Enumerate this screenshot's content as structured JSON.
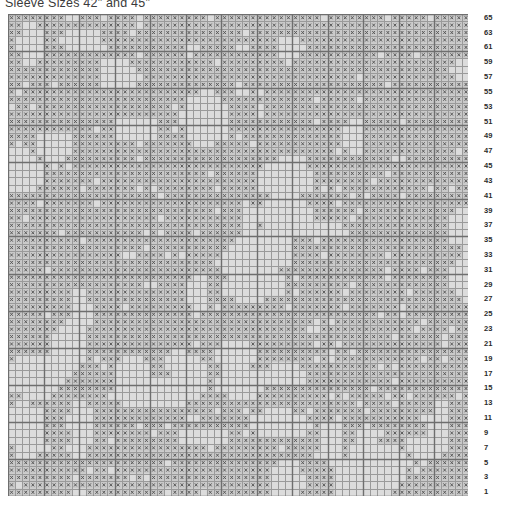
{
  "title": "Sleeve Sizes 42\" and 45\"",
  "chart_data": {
    "type": "heatmap",
    "title": "Sleeve Sizes 42\" and 45\"",
    "xlabel": "",
    "ylabel": "",
    "columns": 65,
    "rows": 65,
    "cell_size_px": 7.1,
    "symbol": "x",
    "grid": true,
    "major_gridline_every": 5,
    "row_label_step": 2,
    "row_labels": [
      65,
      63,
      61,
      59,
      57,
      55,
      53,
      51,
      49,
      47,
      45,
      43,
      41,
      39,
      37,
      35,
      33,
      31,
      29,
      27,
      25,
      23,
      21,
      19,
      17,
      15,
      13,
      11,
      9,
      7,
      5,
      3,
      1
    ],
    "fill_ratio_approx": 0.82,
    "colors": {
      "cell_fill": "#c9c9c9",
      "cell_blank": "#dcdcdc",
      "symbol": "#5a5a5a",
      "minor_gridline": "#9a9a9a",
      "major_gridline": "#6e6e6e",
      "label_text": "#2b2b2b",
      "title_text": "#3a3a3a",
      "background": "#ffffff"
    }
  }
}
